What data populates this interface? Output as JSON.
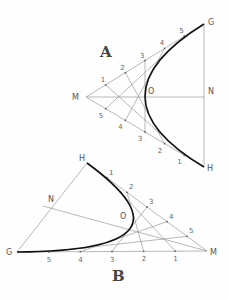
{
  "figures": [
    {
      "id": "A",
      "title": "A",
      "points": {
        "M": [
          86,
          97
        ],
        "G": [
          204,
          24
        ],
        "H": [
          204,
          167
        ],
        "N": [
          204,
          97
        ],
        "O": [
          146,
          97
        ]
      },
      "point_labels": {
        "M": "M",
        "G": "G",
        "H": "H",
        "N": "N",
        "O": "O"
      },
      "divisions_side1": {
        "from": "M",
        "to": "G",
        "labels": [
          "1",
          "2",
          "3",
          "4",
          "5"
        ]
      },
      "divisions_side2": {
        "from": "M",
        "to": "H",
        "labels": [
          "5",
          "4",
          "3",
          "2",
          "1"
        ]
      },
      "curve": "parabola tangent to MG at G and MH at H"
    },
    {
      "id": "B",
      "title": "B",
      "points": {
        "G": [
          17,
          252
        ],
        "H": [
          87,
          163
        ],
        "M": [
          207,
          251
        ],
        "N": [
          51,
          208
        ],
        "O": [
          125,
          222
        ]
      },
      "point_labels": {
        "G": "G",
        "H": "H",
        "M": "M",
        "N": "N",
        "O": "O"
      },
      "divisions_side1": {
        "from": "H",
        "to": "M",
        "labels": [
          "1",
          "2",
          "3",
          "4",
          "5"
        ]
      },
      "divisions_side2": {
        "from": "G",
        "to": "M",
        "labels": [
          "5",
          "4",
          "3",
          "2",
          "1"
        ]
      },
      "curve": "parabola tangent to HM at H and GM at G"
    }
  ],
  "colors": {
    "construction_line": "#8a8a8a",
    "curve": "#111111",
    "labels": "#555555"
  }
}
